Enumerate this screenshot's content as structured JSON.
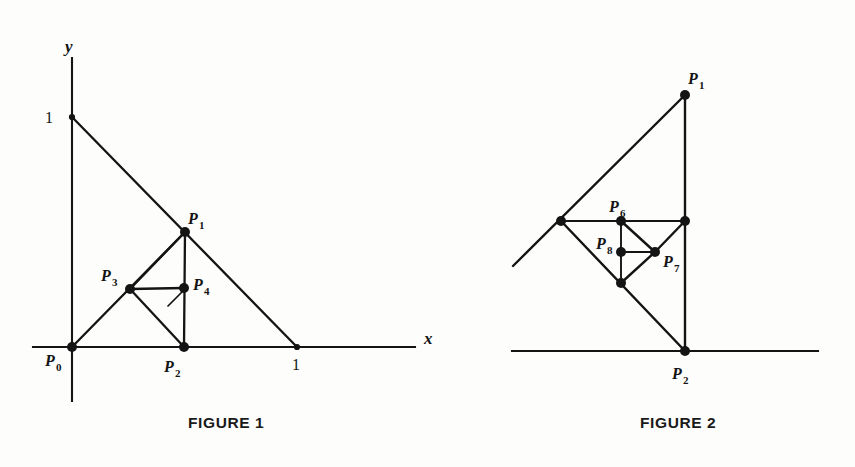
{
  "page": {
    "background_color": "#fdfdfc",
    "ink_color": "#141414",
    "width": 855,
    "height": 467
  },
  "figure1": {
    "caption": "FIGURE 1",
    "axes": {
      "x_axis_label": "x",
      "y_axis_label": "y",
      "x_tick_label": "1",
      "y_tick_label": "1",
      "x_axis_start_x": 33,
      "x_axis_end_x": 415,
      "x_axis_y": 347,
      "y_axis_top_y": 58,
      "y_axis_bottom_y": 401,
      "y_axis_x": 72
    },
    "points": [
      {
        "id": "P0",
        "label": "P",
        "sub": "0",
        "x": 72,
        "y": 347,
        "label_x": 45,
        "label_y": 366
      },
      {
        "id": "P1",
        "label": "P",
        "sub": "1",
        "x": 185,
        "y": 232,
        "label_x": 188,
        "label_y": 224
      },
      {
        "id": "P2",
        "label": "P",
        "sub": "2",
        "x": 184,
        "y": 347,
        "label_x": 164,
        "label_y": 372
      },
      {
        "id": "P3",
        "label": "P",
        "sub": "3",
        "x": 130,
        "y": 289,
        "label_x": 101,
        "label_y": 281
      },
      {
        "id": "P4",
        "label": "P",
        "sub": "4",
        "x": 184,
        "y": 288,
        "label_x": 193,
        "label_y": 290
      }
    ],
    "tick_marks": {
      "y_one_x": 72,
      "y_one_y": 117,
      "y_one_label_x": 53,
      "y_one_label_y": 123,
      "x_one_x": 297,
      "x_one_y": 347,
      "x_one_label_x": 292,
      "x_one_label_y": 370
    },
    "segments": [
      {
        "name": "hypotenuse",
        "x1": 72,
        "y1": 117,
        "x2": 297,
        "y2": 347
      },
      {
        "name": "P0-P1",
        "x1": 72,
        "y1": 347,
        "x2": 185,
        "y2": 232
      },
      {
        "name": "P1-P2",
        "x1": 185,
        "y1": 232,
        "x2": 184,
        "y2": 347
      },
      {
        "name": "P1-P3",
        "x1": 185,
        "y1": 232,
        "x2": 130,
        "y2": 289
      },
      {
        "name": "P3-P2",
        "x1": 130,
        "y1": 289,
        "x2": 184,
        "y2": 347
      },
      {
        "name": "P3-P4",
        "x1": 130,
        "y1": 289,
        "x2": 184,
        "y2": 288
      },
      {
        "name": "right-angle-tick",
        "x1": 168,
        "y1": 306,
        "x2": 183,
        "y2": 291
      }
    ]
  },
  "figure2": {
    "caption": "FIGURE 2",
    "axis": {
      "x_axis_start_x": 512,
      "x_axis_end_x": 818,
      "x_axis_y": 351
    },
    "points": [
      {
        "id": "P1",
        "label": "P",
        "sub": "1",
        "x": 685,
        "y": 95,
        "label_x": 688,
        "label_y": 84
      },
      {
        "id": "P2",
        "label": "P",
        "sub": "2",
        "x": 685,
        "y": 351,
        "label_x": 672,
        "label_y": 379
      },
      {
        "id": "P6",
        "label": "P",
        "sub": "6",
        "x": 621,
        "y": 221,
        "label_x": 609,
        "label_y": 212
      },
      {
        "id": "P7",
        "label": "P",
        "sub": "7",
        "x": 655,
        "y": 252,
        "label_x": 663,
        "label_y": 267
      },
      {
        "id": "P8",
        "label": "P",
        "sub": "8",
        "x": 621,
        "y": 252,
        "label_x": 596,
        "label_y": 249
      },
      {
        "id": "V-left",
        "label": "",
        "sub": "",
        "x": 561,
        "y": 221,
        "label_x": 0,
        "label_y": 0
      },
      {
        "id": "V-right",
        "label": "",
        "sub": "",
        "x": 685,
        "y": 221,
        "label_x": 0,
        "label_y": 0
      },
      {
        "id": "V-bottom",
        "label": "",
        "sub": "",
        "x": 621,
        "y": 283,
        "label_x": 0,
        "label_y": 0
      }
    ],
    "segments": [
      {
        "name": "P1-down-left-ray",
        "x1": 685,
        "y1": 95,
        "x2": 513,
        "y2": 266
      },
      {
        "name": "P1-P2-vertical",
        "x1": 685,
        "y1": 95,
        "x2": 685,
        "y2": 351
      },
      {
        "name": "Vleft-Vright",
        "x1": 561,
        "y1": 221,
        "x2": 685,
        "y2": 221
      },
      {
        "name": "Vleft-P2",
        "x1": 561,
        "y1": 221,
        "x2": 685,
        "y2": 351
      },
      {
        "name": "P6-Vbottom",
        "x1": 621,
        "y1": 221,
        "x2": 621,
        "y2": 283
      },
      {
        "name": "P6-P7",
        "x1": 621,
        "y1": 221,
        "x2": 655,
        "y2": 252
      },
      {
        "name": "Vright-P7",
        "x1": 685,
        "y1": 221,
        "x2": 655,
        "y2": 252
      },
      {
        "name": "P8-P7",
        "x1": 621,
        "y1": 252,
        "x2": 655,
        "y2": 252
      },
      {
        "name": "P7-Vbottom",
        "x1": 655,
        "y1": 252,
        "x2": 621,
        "y2": 283
      }
    ]
  }
}
